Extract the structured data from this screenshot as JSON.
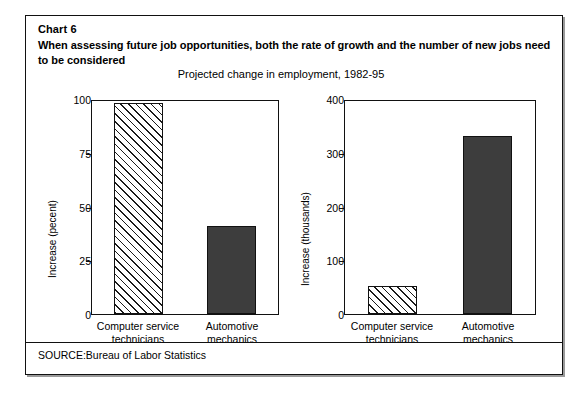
{
  "figure": {
    "chart_number": "Chart 6",
    "headline": "When assessing future job opportunities, both the rate of growth and the number of new jobs need to be considered",
    "subtitle": "Projected change in employment, 1982-95",
    "source": "SOURCE:Bureau of Labor Statistics"
  },
  "colors": {
    "ink": "#111111",
    "solid_bar_fill": "#3d3d3d",
    "hatch_line": "#1a1a1a",
    "background": "#ffffff"
  },
  "chart_data": [
    {
      "type": "bar",
      "panel": "left",
      "title": "",
      "xlabel": "",
      "ylabel": "Increase (pecent)",
      "categories": [
        "Computer service technicians",
        "Automotive mechanics"
      ],
      "values": [
        98,
        41
      ],
      "ylim": [
        0,
        100
      ],
      "yticks": [
        0,
        25,
        50,
        75,
        100
      ],
      "ytick_labels": [
        "0",
        "25",
        "50",
        "75",
        "100"
      ],
      "bar_styles": [
        "hatched",
        "solid"
      ],
      "grid": false,
      "legend": "none"
    },
    {
      "type": "bar",
      "panel": "right",
      "title": "",
      "xlabel": "",
      "ylabel": "Increase (thousands)",
      "categories": [
        "Computer service technicians",
        "Automotive mechanics"
      ],
      "values": [
        53,
        331
      ],
      "ylim": [
        0,
        400
      ],
      "yticks": [
        0,
        100,
        200,
        300,
        400
      ],
      "ytick_labels": [
        "0",
        "100",
        "200",
        "300",
        "400"
      ],
      "bar_styles": [
        "hatched",
        "solid"
      ],
      "grid": false,
      "legend": "none"
    }
  ]
}
